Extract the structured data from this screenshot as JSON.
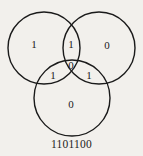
{
  "figure": {
    "type": "venn-diagram-3-set",
    "background_color": "#f2f0ec",
    "stroke_color": "#1a1a1a",
    "caption": "1101100",
    "circles": [
      {
        "name": "left-circle",
        "cx": 44,
        "cy": 48,
        "r": 36
      },
      {
        "name": "right-circle",
        "cx": 99,
        "cy": 48,
        "r": 36
      },
      {
        "name": "bottom-circle",
        "cx": 72,
        "cy": 98,
        "r": 38
      }
    ],
    "regions": [
      {
        "name": "left-only",
        "value": "1",
        "x": 34,
        "y": 45
      },
      {
        "name": "left-right",
        "value": "1",
        "x": 71,
        "y": 45
      },
      {
        "name": "right-only",
        "value": "0",
        "x": 107,
        "y": 46
      },
      {
        "name": "center-all-three",
        "value": "0",
        "x": 71,
        "y": 66
      },
      {
        "name": "left-bottom",
        "value": "1",
        "x": 53,
        "y": 76
      },
      {
        "name": "right-bottom",
        "value": "1",
        "x": 89,
        "y": 76
      },
      {
        "name": "bottom-only",
        "value": "0",
        "x": 71,
        "y": 105
      }
    ]
  }
}
